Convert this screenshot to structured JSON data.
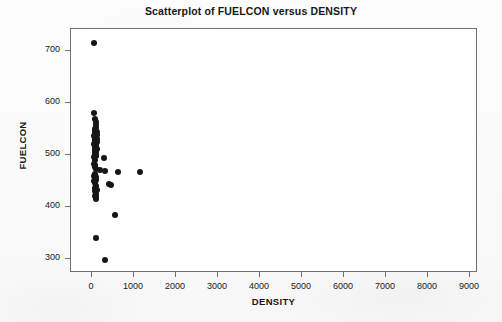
{
  "chart_data": {
    "type": "scatter",
    "title": "Scatterplot of FUELCON versus DENSITY",
    "xlabel": "DENSITY",
    "ylabel": "FUELCON",
    "xlim": [
      -500,
      9700
    ],
    "ylim": [
      270,
      735
    ],
    "grid": false,
    "legend": null,
    "xticks": [
      0,
      1000,
      2000,
      3000,
      4000,
      5000,
      6000,
      7000,
      8000,
      9000
    ],
    "xticklabels": [
      "0",
      "1000",
      "2000",
      "3000",
      "4000",
      "5000",
      "6000",
      "7000",
      "8000",
      "9000"
    ],
    "yticks": [
      300,
      400,
      500,
      600,
      700
    ],
    "yticklabels": [
      "300",
      "400",
      "500",
      "600",
      "700"
    ],
    "marker": "filled-circle",
    "marker_color": "#161616",
    "marker_size": 6,
    "series": [
      {
        "name": "FUELCON vs DENSITY",
        "points": [
          [
            70,
            713
          ],
          [
            60,
            578
          ],
          [
            95,
            568
          ],
          [
            110,
            562
          ],
          [
            130,
            556
          ],
          [
            120,
            550
          ],
          [
            85,
            548
          ],
          [
            105,
            545
          ],
          [
            140,
            543
          ],
          [
            95,
            540
          ],
          [
            115,
            538
          ],
          [
            150,
            536
          ],
          [
            80,
            534
          ],
          [
            125,
            532
          ],
          [
            100,
            530
          ],
          [
            135,
            528
          ],
          [
            90,
            526
          ],
          [
            145,
            524
          ],
          [
            110,
            522
          ],
          [
            75,
            520
          ],
          [
            130,
            518
          ],
          [
            105,
            516
          ],
          [
            120,
            514
          ],
          [
            95,
            512
          ],
          [
            140,
            510
          ],
          [
            85,
            508
          ],
          [
            115,
            506
          ],
          [
            100,
            504
          ],
          [
            125,
            500
          ],
          [
            90,
            498
          ],
          [
            110,
            496
          ],
          [
            80,
            494
          ],
          [
            300,
            492
          ],
          [
            95,
            488
          ],
          [
            70,
            480
          ],
          [
            105,
            478
          ],
          [
            85,
            475
          ],
          [
            120,
            472
          ],
          [
            220,
            470
          ],
          [
            340,
            468
          ],
          [
            640,
            466
          ],
          [
            1160,
            465
          ],
          [
            90,
            462
          ],
          [
            75,
            458
          ],
          [
            110,
            455
          ],
          [
            95,
            452
          ],
          [
            130,
            450
          ],
          [
            80,
            448
          ],
          [
            100,
            445
          ],
          [
            440,
            442
          ],
          [
            480,
            440
          ],
          [
            115,
            438
          ],
          [
            90,
            434
          ],
          [
            140,
            430
          ],
          [
            105,
            428
          ],
          [
            120,
            424
          ],
          [
            95,
            420
          ],
          [
            130,
            418
          ],
          [
            110,
            414
          ],
          [
            575,
            382
          ],
          [
            125,
            338
          ],
          [
            330,
            297
          ],
          [
            9350,
            289
          ]
        ]
      }
    ]
  }
}
